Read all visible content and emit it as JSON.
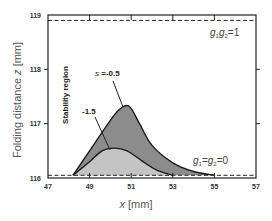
{
  "chart_data": {
    "type": "area",
    "title": "",
    "xlabel": "x [mm]",
    "ylabel": "Folding distance z [mm]",
    "xlim": [
      47,
      57
    ],
    "ylim": [
      116,
      119
    ],
    "xticks": [
      "47",
      "49",
      "51",
      "53",
      "55",
      "57"
    ],
    "yticks": [
      "116",
      "117",
      "118",
      "119"
    ],
    "grid": false,
    "legend": "none",
    "region_label": "Stability region",
    "series": [
      {
        "name": "s = -0.5",
        "label": "s =-0.5",
        "fill": "#8c8c8c",
        "x": [
          48.2,
          49.0,
          49.8,
          50.4,
          50.9,
          51.4,
          52.0,
          53.0,
          54.0,
          55.0
        ],
        "y": [
          116.05,
          116.5,
          116.95,
          117.25,
          117.32,
          117.0,
          116.6,
          116.28,
          116.12,
          116.05
        ]
      },
      {
        "name": "s = -1.5",
        "label": "-1.5",
        "fill": "#c4c4c4",
        "x": [
          48.2,
          49.0,
          49.6,
          50.2,
          50.8,
          51.5,
          52.2,
          53.0
        ],
        "y": [
          116.05,
          116.3,
          116.5,
          116.55,
          116.5,
          116.32,
          116.15,
          116.05
        ]
      }
    ],
    "reference_lines": [
      {
        "label_parts": [
          "g",
          "1",
          "g",
          "2",
          "=1"
        ],
        "label": "g1g2=1",
        "y": 118.9,
        "style": "dashed"
      },
      {
        "label_parts": [
          "g",
          "1",
          "=g",
          "2",
          "=0"
        ],
        "label": "g1=g2=0",
        "y": 116.05,
        "style": "dashed"
      }
    ]
  },
  "text": {
    "ylabel_main": "Folding distance ",
    "ylabel_var": "z",
    "ylabel_unit": " [mm]",
    "xlabel_var": "x",
    "xlabel_unit": " [mm]",
    "region_label": "Stability region",
    "s_prefix": "s",
    "s05_value": " =-0.5",
    "s15_value": "-1.5",
    "g_top": {
      "g1": "g",
      "sub1": "1",
      "g2": "g",
      "sub2": "2",
      "rest": "=1"
    },
    "g_bottom": {
      "g1": "g",
      "sub1": "1",
      "mid": "=",
      "g2": "g",
      "sub2": "2",
      "rest": "=0"
    }
  }
}
